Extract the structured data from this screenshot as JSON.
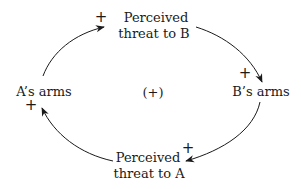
{
  "diagram": {
    "type": "causal-loop",
    "loop_polarity": "(+)",
    "nodes": [
      {
        "id": "threat_b",
        "line1": "Perceived",
        "line2": "threat to B"
      },
      {
        "id": "b_arms",
        "line1": "B’s arms"
      },
      {
        "id": "threat_a",
        "line1": "Perceived",
        "line2": "threat to A"
      },
      {
        "id": "a_arms",
        "line1": "A’s arms"
      }
    ],
    "links": [
      {
        "from": "a_arms",
        "to": "threat_b",
        "polarity": "+"
      },
      {
        "from": "threat_b",
        "to": "b_arms",
        "polarity": "+"
      },
      {
        "from": "b_arms",
        "to": "threat_a",
        "polarity": "+"
      },
      {
        "from": "threat_a",
        "to": "a_arms",
        "polarity": "+"
      }
    ],
    "colors": {
      "ink": "#1a1a1a",
      "background": "#ffffff"
    }
  }
}
